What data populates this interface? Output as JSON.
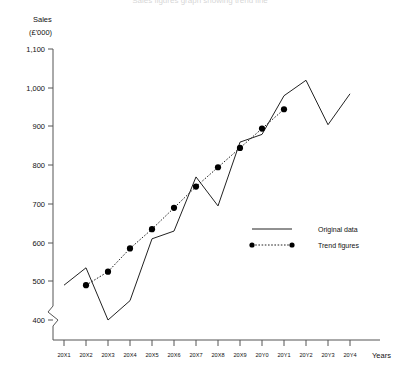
{
  "chart_data": {
    "type": "line",
    "title": "Sales figures graph showing trend line",
    "ylabel": "Sales",
    "ylabel_units": "(£'000)",
    "xlabel": "Years",
    "ylim": [
      400,
      1100
    ],
    "y_ticks": [
      "400",
      "500",
      "600",
      "700",
      "800",
      "900",
      "1,000",
      "1,100"
    ],
    "y_tick_values": [
      400,
      500,
      600,
      700,
      800,
      900,
      1000,
      1100
    ],
    "axis_break": true,
    "grid": false,
    "legend_position": "right-middle",
    "categories": [
      "20X1",
      "20X2",
      "20X3",
      "20X4",
      "20X5",
      "20X6",
      "20X7",
      "20X8",
      "20X9",
      "20Y0",
      "20Y1",
      "20Y2",
      "20Y3",
      "20Y4"
    ],
    "series": [
      {
        "name": "Original data",
        "style": "solid",
        "values": [
          490,
          535,
          400,
          450,
          610,
          630,
          770,
          695,
          860,
          880,
          980,
          1020,
          905,
          985
        ]
      },
      {
        "name": "Trend figures",
        "style": "dotted-markers",
        "x": [
          "20X2",
          "20X3",
          "20X4",
          "20X5",
          "20X6",
          "20X7",
          "20X8",
          "20X9",
          "20Y0",
          "20Y1",
          "20Y2"
        ],
        "values": [
          490,
          525,
          585,
          635,
          690,
          745,
          795,
          845,
          895,
          945,
          null
        ]
      }
    ]
  },
  "axis": {
    "y_title_line1": "Sales",
    "y_title_line2": "(£'000)",
    "x_title": "Years"
  },
  "legend": {
    "items": [
      {
        "label": "Original data",
        "marker": "solid-line"
      },
      {
        "label": "Trend figures",
        "marker": "dotted-line-with-dots"
      }
    ]
  }
}
